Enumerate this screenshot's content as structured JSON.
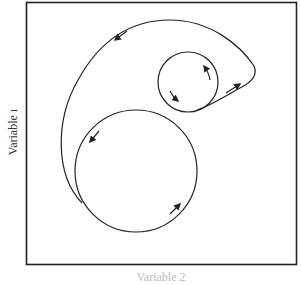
{
  "figure": {
    "y_axis_label": "Variable ı",
    "x_axis_label": "Variable 2",
    "x_axis_label_visibility": "cut off at bottom edge",
    "frame": {
      "x": 26,
      "y": 2,
      "width": 270,
      "height": 263,
      "stroke": "#222222"
    }
  },
  "diagram": {
    "type": "phase-space trajectory",
    "elements": [
      {
        "id": "large-circle",
        "shape": "circle",
        "cx": 136,
        "cy": 171,
        "r": 61,
        "direction": "counter-clockwise"
      },
      {
        "id": "small-circle",
        "shape": "circle",
        "cx": 188,
        "cy": 82,
        "r": 30,
        "direction": "counter-clockwise"
      },
      {
        "id": "outer-loop",
        "shape": "closed curve",
        "description": "connects the bottom-left of the large circle to the bottom of the small circle, sweeping around the top and left",
        "direction": "counter-clockwise"
      }
    ],
    "arrows": [
      {
        "on": "outer-loop",
        "x": 120,
        "y": 33,
        "direction": "down-left"
      },
      {
        "on": "outer-loop",
        "x": 235,
        "y": 87,
        "direction": "up-right"
      },
      {
        "on": "small-circle",
        "x": 204,
        "y": 70,
        "direction": "up-left"
      },
      {
        "on": "small-circle",
        "x": 173,
        "y": 97,
        "direction": "down-right"
      },
      {
        "on": "large-circle",
        "x": 95,
        "y": 136,
        "direction": "down-left"
      },
      {
        "on": "large-circle",
        "x": 175,
        "y": 208,
        "direction": "up-right"
      }
    ],
    "stroke_color": "#222222"
  }
}
